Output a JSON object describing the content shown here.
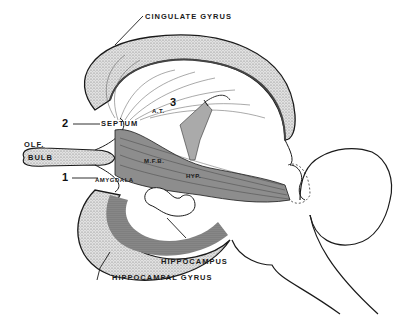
{
  "diagram": {
    "title": "",
    "type": "anatomical illustration of the limbic system (sagittal view)",
    "labels": {
      "cingulate_gyrus": "CINGULATE GYRUS",
      "septum": "SEPTUM",
      "olf": "OLF.",
      "bulb": "BULB",
      "amygdala": "AMYGDALA",
      "at": "A.T.",
      "mfb": "M.F.B.",
      "hyp": "HYP.",
      "hippocampus": "HIPPOCAMPUS",
      "hippocampal_gyrus": "HIPPOCAMPAL GYRUS"
    },
    "numbers": {
      "n1": "1",
      "n2": "2",
      "n3": "3"
    },
    "colors": {
      "ink": "#1a1a1a",
      "stipple_light": "#c8c8c8",
      "stipple_dark": "#6e6e6e",
      "background": "#ffffff"
    }
  }
}
